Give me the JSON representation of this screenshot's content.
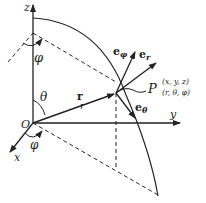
{
  "diagram": {
    "axes": {
      "z": "z",
      "y": "y",
      "x": "x",
      "origin": "O"
    },
    "angles": {
      "theta": "θ",
      "phi_top": "φ",
      "phi_bottom": "φ"
    },
    "vector_r": "r",
    "length_r": "r",
    "unit_vectors": {
      "e_phi": {
        "base": "e",
        "sub": "φ"
      },
      "e_r": {
        "base": "e",
        "sub": "r"
      },
      "e_theta": {
        "base": "e",
        "sub": "θ"
      }
    },
    "point": {
      "name": "P",
      "cartesian": "(x, y, z)",
      "spherical": "(r, θ, φ)"
    }
  }
}
